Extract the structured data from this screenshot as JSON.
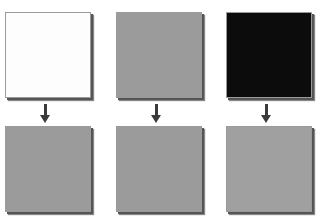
{
  "diagram": {
    "columns": [
      {
        "input": {
          "label": "white",
          "color": "#fdfdfd"
        },
        "output": {
          "label": "gray",
          "color": "#9b9b9b"
        }
      },
      {
        "input": {
          "label": "gray",
          "color": "#9b9b9b"
        },
        "output": {
          "label": "gray",
          "color": "#9b9b9b"
        }
      },
      {
        "input": {
          "label": "black",
          "color": "#0c0c0c"
        },
        "output": {
          "label": "gray",
          "color": "#a0a0a0"
        }
      }
    ],
    "arrow_color": "#3a3a3a"
  }
}
